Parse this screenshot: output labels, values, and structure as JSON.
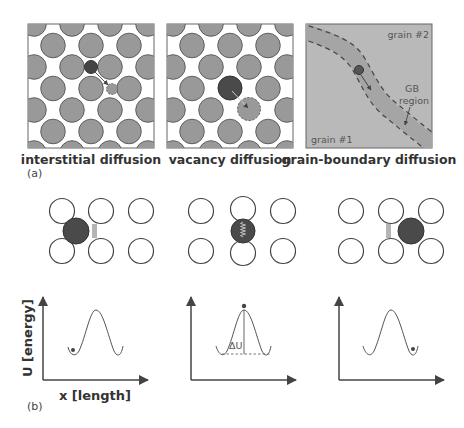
{
  "figure": {
    "part_a": {
      "label": "(a)",
      "panels": [
        {
          "id": "interstitial",
          "caption": "interstitial diffusion"
        },
        {
          "id": "vacancy",
          "caption": "vacancy diffusion"
        },
        {
          "id": "grain_boundary",
          "caption": "grain-boundary diffusion",
          "annotations": {
            "grain_top": "grain #2",
            "grain_bottom": "grain #1",
            "gb_label_line1": "GB",
            "gb_label_line2": "region"
          }
        }
      ]
    },
    "part_b": {
      "label": "(b)",
      "y_axis_label": "U [energy]",
      "x_axis_label": "x [length]",
      "barrier_label": "ΔU",
      "states": [
        {
          "id": "initial",
          "atom_position": "left well"
        },
        {
          "id": "saddle",
          "atom_position": "barrier top"
        },
        {
          "id": "final",
          "atom_position": "right well"
        }
      ]
    },
    "colors": {
      "lattice_atom": "#999999",
      "lattice_stroke": "#555555",
      "diffusing_atom": "#444444",
      "grain_fill": "#b8b8b8",
      "gb_band": "#a6a6a6",
      "line": "#444444"
    }
  }
}
